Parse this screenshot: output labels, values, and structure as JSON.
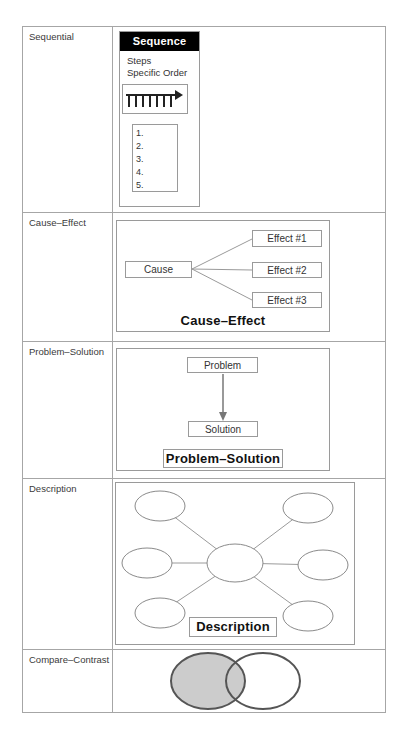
{
  "figure": {
    "rows": [
      {
        "label": "Sequential"
      },
      {
        "label": "Cause–Effect"
      },
      {
        "label": "Problem–Solution"
      },
      {
        "label": "Description"
      },
      {
        "label": "Compare–Contrast"
      }
    ],
    "sequence": {
      "title": "Sequence",
      "line1": "Steps",
      "line2": "Specific Order",
      "list": [
        "1.",
        "2.",
        "3.",
        "4.",
        "5."
      ]
    },
    "cause_effect": {
      "cause": "Cause",
      "effect1": "Effect #1",
      "effect2": "Effect #2",
      "effect3": "Effect #3",
      "title": "Cause–Effect"
    },
    "problem_solution": {
      "problem": "Problem",
      "solution": "Solution",
      "title": "Problem–Solution"
    },
    "description": {
      "title": "Description"
    }
  },
  "colors": {
    "sequence_header_bg": "#000000",
    "sequence_header_text": "#ffffff",
    "box_border": "#9a9a9a",
    "table_border": "#a6a6a6",
    "venn_fill": "#cccccc",
    "venn_stroke": "#555555"
  }
}
